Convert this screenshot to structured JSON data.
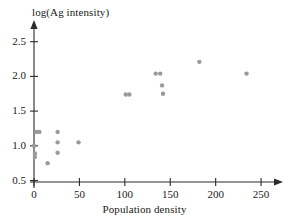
{
  "chart_data": {
    "type": "scatter",
    "title": "",
    "xlabel": "Population density",
    "ylabel": "log(Ag intensity)",
    "xlim": [
      -10,
      265
    ],
    "ylim": [
      0.45,
      2.65
    ],
    "xticks": [
      0,
      50,
      100,
      150,
      200,
      250
    ],
    "xtick_labels": [
      "0",
      "50",
      "100",
      "150",
      "200",
      "250"
    ],
    "yticks": [
      0.5,
      1.0,
      1.5,
      2.0,
      2.5
    ],
    "ytick_labels": [
      "0.5",
      "1.0",
      "1.5",
      "2.0",
      "2.5"
    ],
    "grid": false,
    "legend": "none",
    "marker_color": "#9a9a9a",
    "axis_color": "#2b2b2b",
    "points": [
      {
        "x": 0,
        "y": 1.0
      },
      {
        "x": 1,
        "y": 0.89
      },
      {
        "x": 1,
        "y": 0.84
      },
      {
        "x": 3,
        "y": 1.2
      },
      {
        "x": 6,
        "y": 1.2
      },
      {
        "x": 15,
        "y": 0.75
      },
      {
        "x": 26,
        "y": 1.2
      },
      {
        "x": 26,
        "y": 1.05
      },
      {
        "x": 26,
        "y": 0.9
      },
      {
        "x": 49,
        "y": 1.05
      },
      {
        "x": 101,
        "y": 1.74
      },
      {
        "x": 105,
        "y": 1.74
      },
      {
        "x": 134,
        "y": 2.04
      },
      {
        "x": 139,
        "y": 2.04
      },
      {
        "x": 141,
        "y": 1.87
      },
      {
        "x": 142,
        "y": 1.75
      },
      {
        "x": 182,
        "y": 2.21
      },
      {
        "x": 234,
        "y": 2.04
      }
    ]
  }
}
